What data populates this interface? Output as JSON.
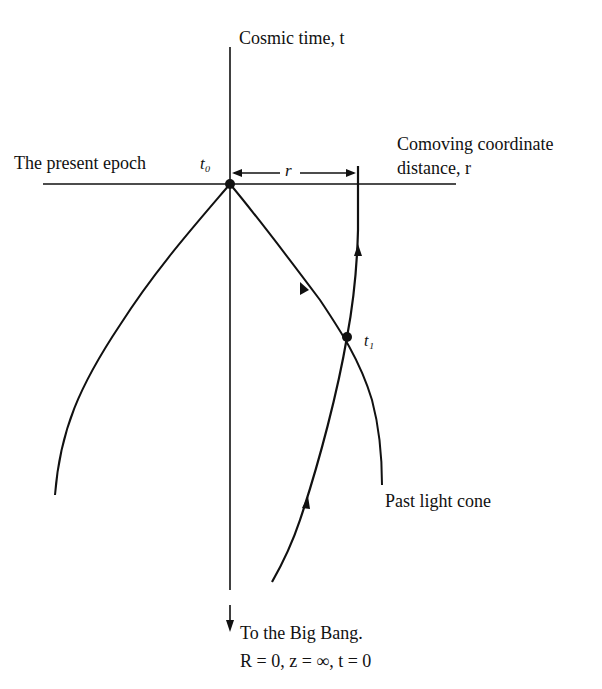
{
  "labels": {
    "time_axis": "Cosmic time, t",
    "present_epoch": "The present epoch",
    "t0": "t₀",
    "r_marker": "r",
    "comoving_line1": "Comoving coordinate",
    "comoving_line2": "distance, r",
    "t1": "t₁",
    "past_light_cone": "Past light cone",
    "big_bang_line1": "To the Big Bang.",
    "big_bang_line2": "R = 0, z = ∞, t = 0"
  },
  "colors": {
    "ink": "#111111",
    "background": "#ffffff"
  },
  "elements": {
    "time_axis": {
      "x": 230,
      "y_top": 47,
      "y_bottom": 590
    },
    "present_epoch_line": {
      "y": 184,
      "x_left": 43,
      "x_right": 456
    },
    "event_t0": {
      "x": 230,
      "y": 184
    },
    "event_t1": {
      "x": 347,
      "y": 337
    },
    "big_bang_arrow": {
      "x": 230,
      "y_top": 605,
      "y_bottom": 630
    }
  }
}
